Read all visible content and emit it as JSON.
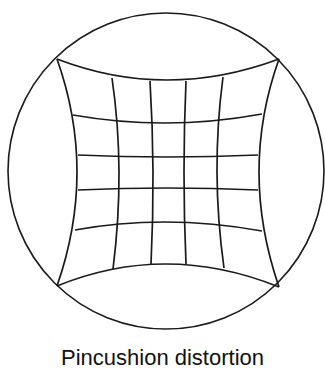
{
  "figure": {
    "type": "pincushion-distortion-diagram",
    "caption": "Pincushion distortion",
    "stroke_color": "#1a1a1a",
    "background": "#ffffff",
    "circle": {
      "cx": 166,
      "cy": 171,
      "r": 158
    },
    "grid": {
      "columns": 5,
      "rows": 5,
      "corners": {
        "top_left": [
          57,
          59
        ],
        "top_right": [
          279,
          59
        ],
        "bottom_left": [
          57,
          286
        ],
        "bottom_right": [
          279,
          287
        ]
      },
      "horizontal_lines": [
        {
          "left": [
            57,
            59
          ],
          "mid": [
            167,
            80
          ],
          "right": [
            279,
            59
          ]
        },
        {
          "left": [
            73,
            115
          ],
          "mid": [
            167,
            123
          ],
          "right": [
            262,
            114
          ]
        },
        {
          "left": [
            78,
            155
          ],
          "mid": [
            167,
            157
          ],
          "right": [
            258,
            155
          ]
        },
        {
          "left": [
            78,
            190
          ],
          "mid": [
            167,
            188
          ],
          "right": [
            258,
            190
          ]
        },
        {
          "left": [
            75,
            230
          ],
          "mid": [
            167,
            222
          ],
          "right": [
            262,
            231
          ]
        },
        {
          "left": [
            57,
            286
          ],
          "mid": [
            167,
            264
          ],
          "right": [
            279,
            287
          ]
        }
      ],
      "vertical_lines": [
        {
          "top": [
            57,
            59
          ],
          "mid": [
            77,
            172
          ],
          "bottom": [
            57,
            286
          ]
        },
        {
          "top": [
            112,
            78
          ],
          "mid": [
            119,
            172
          ],
          "bottom": [
            113,
            269
          ]
        },
        {
          "top": [
            150,
            81
          ],
          "mid": [
            153,
            172
          ],
          "bottom": [
            151,
            264
          ]
        },
        {
          "top": [
            186,
            81
          ],
          "mid": [
            184,
            172
          ],
          "bottom": [
            186,
            264
          ]
        },
        {
          "top": [
            223,
            77
          ],
          "mid": [
            217,
            172
          ],
          "bottom": [
            224,
            268
          ]
        },
        {
          "top": [
            279,
            59
          ],
          "mid": [
            259,
            172
          ],
          "bottom": [
            279,
            287
          ]
        }
      ]
    }
  }
}
